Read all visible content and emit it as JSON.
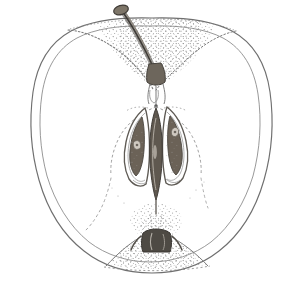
{
  "document": {
    "kind": "botanical-line-drawing",
    "subject": "apple-longitudinal-section",
    "title": "Apple fruit in longitudinal section",
    "background_color": "#ffffff",
    "ink_color": "#6f6f6f",
    "dark_ink_color": "#4a4a4a",
    "seed_fill_color": "#6b6257",
    "stipple_color": "#8a8a8a",
    "canvas": {
      "width": 302,
      "height": 285
    }
  },
  "parts": {
    "skin_outline": {
      "name": "Fruit skin outline",
      "stroke": "#6f6f6f",
      "stroke_width": 1.1
    },
    "flesh_outline": {
      "name": "Flesh inner contour",
      "stroke": "#7d7d7d",
      "stroke_width": 0.9
    },
    "stem": {
      "name": "Stem (pedicel)",
      "fill": "#7a7268",
      "stroke": "#4a4a4a"
    },
    "stem_cavity": {
      "name": "Stem cavity (stippled)",
      "stipple": "#8a8a8a"
    },
    "vascular_bundle": {
      "name": "Vascular strand to core",
      "stroke": "#6f6f6f"
    },
    "core_line": {
      "name": "Core line (dotted vascular ring)",
      "stroke": "#9a9a9a",
      "dash": "2 3"
    },
    "left_carpel": {
      "name": "Left seed locule",
      "seed_fill": "#6b6257"
    },
    "right_carpel": {
      "name": "Right seed locule",
      "seed_fill": "#6b6257"
    },
    "central_axis": {
      "name": "Central axis locule",
      "fill": "#5f584f"
    },
    "calyx_basin": {
      "name": "Calyx basin (stippled mound)",
      "stipple": "#8a8a8a"
    },
    "calyx_remnant": {
      "name": "Calyx / sepal remnant",
      "fill": "#4e4a44"
    }
  }
}
